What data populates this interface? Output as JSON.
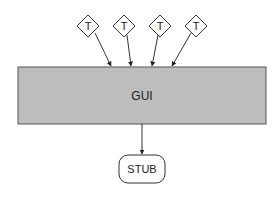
{
  "diagram": {
    "main_box": {
      "label": "GUI",
      "fill": "#bdbdbd",
      "stroke": "#555555"
    },
    "inputs": [
      {
        "label": "T"
      },
      {
        "label": "T"
      },
      {
        "label": "T"
      },
      {
        "label": "T"
      }
    ],
    "output": {
      "label": "STUB"
    },
    "colors": {
      "line": "#333333",
      "background": "#ffffff"
    }
  }
}
